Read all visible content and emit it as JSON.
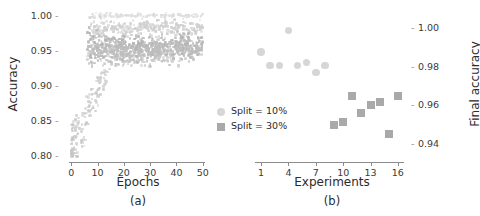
{
  "figure": {
    "background": "#ffffff"
  },
  "legend": {
    "entries": [
      {
        "label": "Split = 10%",
        "marker": "circle",
        "color": "#d6d6d6",
        "name": "split-10"
      },
      {
        "label": "Split = 30%",
        "marker": "square",
        "color": "#a9a9a9",
        "name": "split-30"
      }
    ]
  },
  "chart_data": [
    {
      "id": "panel-a",
      "type": "scatter",
      "panel_caption": "(a)",
      "title": "",
      "xlabel": "Epochs",
      "ylabel": "Accuracy",
      "xlim": [
        -2,
        52
      ],
      "ylim": [
        0.795,
        1.005
      ],
      "xticks": [
        0,
        10,
        20,
        30,
        40,
        50
      ],
      "xticklabels": [
        "0",
        "10",
        "20",
        "30",
        "40",
        "50"
      ],
      "yticks": [
        0.8,
        0.85,
        0.9,
        0.95,
        1.0
      ],
      "yticklabels": [
        "0.80",
        "0.85",
        "0.90",
        "0.95",
        "1.00"
      ],
      "grid": false,
      "legend_position": "outside-right",
      "description": "Per-epoch accuracy for many training runs; curves converge into horizontal bands near 1.00, 0.98 and 0.95-0.96 after roughly 10 epochs, with sparse low-accuracy points during early epochs.",
      "bands": [
        {
          "level": 1.0,
          "spread": 0.0015,
          "x_start": 8,
          "color": "#dcdcdc",
          "density": 170,
          "size": 2.2
        },
        {
          "level": 0.982,
          "spread": 0.0055,
          "x_start": 7,
          "color": "#cfcfcf",
          "density": 300,
          "size": 2.6
        },
        {
          "level": 0.958,
          "spread": 0.0075,
          "x_start": 6,
          "color": "#b5b5b5",
          "density": 430,
          "size": 2.6
        },
        {
          "level": 0.95,
          "spread": 0.006,
          "x_start": 6,
          "color": "#bdbdbd",
          "density": 320,
          "size": 2.6
        }
      ],
      "ramp": {
        "count": 300,
        "color": "#c6c6c6",
        "size": 2.6,
        "description": "rising cloud of early-epoch points from 0.80 up to 0.95"
      },
      "scatter_seed": 20240617
    },
    {
      "id": "panel-b",
      "type": "scatter",
      "panel_caption": "(b)",
      "title": "",
      "xlabel": "Experiments",
      "ylabel": "Final accuracy",
      "ylabel_side": "right",
      "xlim": [
        0,
        17
      ],
      "ylim": [
        0.932,
        1.008
      ],
      "xticks": [
        1,
        4,
        7,
        10,
        13,
        16
      ],
      "xticklabels": [
        "1",
        "4",
        "7",
        "10",
        "13",
        "16"
      ],
      "yticks": [
        0.94,
        0.96,
        0.98,
        1.0
      ],
      "yticklabels": [
        "0.94",
        "0.96",
        "0.98",
        "1.00"
      ],
      "grid": false,
      "series": [
        {
          "name": "Split = 10%",
          "marker": "circle",
          "color": "#d6d6d6",
          "x": [
            1,
            2,
            3,
            4,
            5,
            6,
            7,
            8
          ],
          "y": [
            0.9875,
            0.9805,
            0.9805,
            0.9985,
            0.9805,
            0.982,
            0.977,
            0.9805
          ]
        },
        {
          "name": "Split = 30%",
          "marker": "square",
          "color": "#a9a9a9",
          "x": [
            9,
            10,
            11,
            12,
            13,
            14,
            15,
            16
          ],
          "y": [
            0.95,
            0.9515,
            0.965,
            0.956,
            0.9605,
            0.962,
            0.9455,
            0.965
          ]
        }
      ]
    }
  ]
}
